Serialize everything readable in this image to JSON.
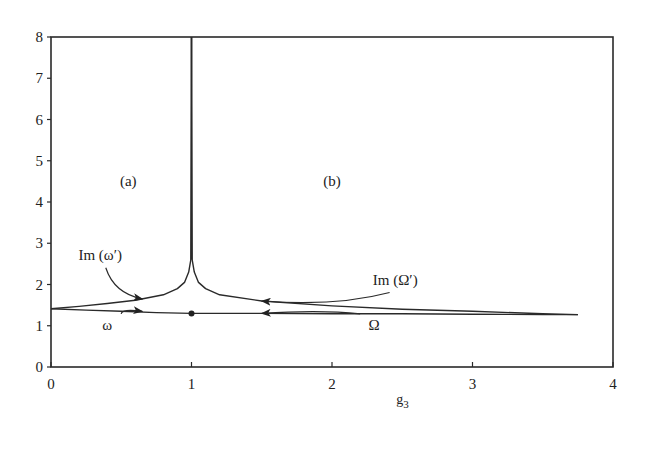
{
  "chart_data": {
    "type": "line",
    "title": "",
    "xlabel": "g3",
    "xlabel_main": "g",
    "xlabel_sub": "3",
    "ylabel": "",
    "xlim": [
      0,
      4
    ],
    "ylim": [
      0,
      8
    ],
    "grid": false,
    "legend": "none",
    "x_ticks": [
      0,
      1,
      2,
      3,
      4
    ],
    "y_ticks": [
      0,
      1,
      2,
      3,
      4,
      5,
      6,
      7,
      8
    ],
    "series": [
      {
        "name": "ω",
        "x": [
          0,
          0.25,
          0.5,
          0.75,
          1.0
        ],
        "values": [
          1.41,
          1.38,
          1.35,
          1.32,
          1.3
        ]
      },
      {
        "name": "Ω",
        "x": [
          1.0,
          1.5,
          2.0,
          2.5,
          3.0,
          3.5,
          3.75
        ],
        "values": [
          1.3,
          1.3,
          1.29,
          1.29,
          1.28,
          1.27,
          1.27
        ]
      },
      {
        "name": "Im (ω′)",
        "x": [
          0,
          0.2,
          0.4,
          0.6,
          0.8,
          0.9,
          0.95,
          0.98,
          0.995,
          1.0
        ],
        "values": [
          1.41,
          1.47,
          1.54,
          1.62,
          1.75,
          1.9,
          2.05,
          2.3,
          2.6,
          8.0
        ]
      },
      {
        "name": "Im (Ω′)",
        "x": [
          1.0,
          1.005,
          1.02,
          1.05,
          1.1,
          1.2,
          1.5,
          2.0,
          2.5,
          3.0,
          3.5,
          3.75
        ],
        "values": [
          8.0,
          2.6,
          2.3,
          2.05,
          1.9,
          1.75,
          1.6,
          1.48,
          1.4,
          1.35,
          1.29,
          1.27
        ]
      }
    ],
    "marker": {
      "x": 1.0,
      "y": 1.3,
      "shape": "dot"
    },
    "regions": [
      {
        "label": "(a)",
        "x": 0.55,
        "y": 4.4
      },
      {
        "label": "(b)",
        "x": 2.0,
        "y": 4.4
      }
    ],
    "annotations": [
      {
        "text": "Im (ω′)",
        "text_x": 0.35,
        "text_y": 2.6,
        "points_to": [
          0.65,
          1.65
        ]
      },
      {
        "text": "Im (Ω′)",
        "text_x": 2.45,
        "text_y": 2.0,
        "points_to": [
          1.5,
          1.6
        ]
      },
      {
        "text": "ω",
        "text_x": 0.4,
        "text_y": 0.9,
        "points_to": [
          0.65,
          1.35
        ]
      },
      {
        "text": "Ω",
        "text_x": 2.3,
        "text_y": 0.9,
        "points_to": [
          1.5,
          1.3
        ]
      }
    ],
    "vertical_line": {
      "x": 1.0,
      "from": 2.6,
      "to": 8.0
    }
  }
}
